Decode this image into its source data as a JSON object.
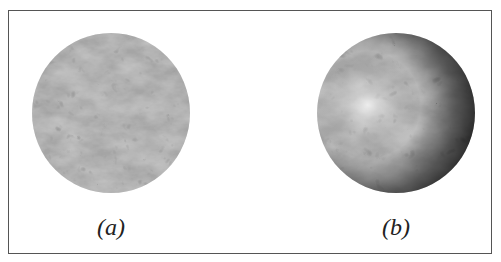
{
  "figure": {
    "panels": [
      {
        "id": "a",
        "label": "(a)",
        "description": "flat marble-textured disc (texture without shading)"
      },
      {
        "id": "b",
        "label": "(b)",
        "description": "marble-textured sphere with lighting/shading (highlight upper-left)"
      }
    ],
    "colors": {
      "border": "#555555",
      "background": "#ffffff",
      "texture_base": "#a6a6a6",
      "texture_vein": "#5a5a5a"
    }
  }
}
